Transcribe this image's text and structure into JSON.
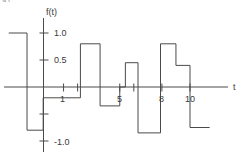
{
  "figure": {
    "clipped_top_text": "a)",
    "ylabel": "f(t)",
    "xlabel": "t",
    "y_ticks": [
      {
        "value": 1.0,
        "label": "1.0"
      },
      {
        "value": 0.5,
        "label": "0.5"
      },
      {
        "value": -0.5,
        "label": ""
      },
      {
        "value": -1.0,
        "label": "-1.0"
      }
    ],
    "x_ticks": [
      {
        "value": 1,
        "label": "1"
      },
      {
        "value": 2,
        "label": ""
      },
      {
        "value": 5,
        "label": "5"
      },
      {
        "value": 6,
        "label": ""
      },
      {
        "value": 8,
        "label": "8"
      },
      {
        "value": 10,
        "label": "10"
      }
    ],
    "line_color": "#4a4a4a",
    "axis_color": "#4a4a4a",
    "text_color": "#3a3a3a",
    "background": "#ffffff"
  },
  "chart_data": {
    "type": "line",
    "title": "",
    "subtitle": "",
    "xlabel": "t",
    "ylabel": "f(t)",
    "xlim": [
      -3.5,
      12.5
    ],
    "ylim": [
      -1.35,
      1.35
    ],
    "grid": false,
    "legend": null,
    "waveform_style": "piecewise-constant staircase",
    "series": [
      {
        "name": "f(t)",
        "steps": [
          {
            "t_start": -2.9,
            "t_end": -1.6,
            "value": 1.0
          },
          {
            "t_start": -1.6,
            "t_end": -0.45,
            "value": -0.8
          },
          {
            "t_start": -0.45,
            "t_end": 2.2,
            "value": -0.2
          },
          {
            "t_start": 2.2,
            "t_end": 3.6,
            "value": 0.8
          },
          {
            "t_start": 3.6,
            "t_end": 5.0,
            "value": -0.35
          },
          {
            "t_start": 5.0,
            "t_end": 5.4,
            "value": 0.0
          },
          {
            "t_start": 5.4,
            "t_end": 6.3,
            "value": 0.45
          },
          {
            "t_start": 6.3,
            "t_end": 7.9,
            "value": -0.85
          },
          {
            "t_start": 7.9,
            "t_end": 9.0,
            "value": 0.8
          },
          {
            "t_start": 9.0,
            "t_end": 10.0,
            "value": 0.4
          },
          {
            "t_start": 10.0,
            "t_end": 11.4,
            "value": -0.75
          }
        ]
      }
    ],
    "axis_ranges": {
      "x": [
        -3.5,
        12.5
      ],
      "y": [
        -1.35,
        1.35
      ]
    }
  }
}
